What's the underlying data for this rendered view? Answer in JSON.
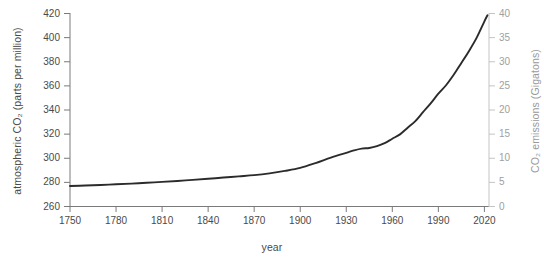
{
  "chart_data": {
    "type": "line",
    "title": "",
    "xlabel": "year",
    "ylabel": "atmospheric CO₂ (parts per million)",
    "ylabel_right": "CO₂ emissions (Gigatons)",
    "xlim": [
      1750,
      2023
    ],
    "ylim": [
      260,
      420
    ],
    "ylim_right": [
      0,
      40
    ],
    "grid": false,
    "legend": null,
    "xticks": [
      1750,
      1780,
      1810,
      1840,
      1870,
      1900,
      1930,
      1960,
      1990,
      2020
    ],
    "xtick_labels": [
      "1750",
      "1780",
      "1810",
      "1840",
      "1870",
      "1900",
      "1930",
      "1960",
      "1990",
      "2020"
    ],
    "yticks": [
      260,
      280,
      300,
      320,
      340,
      360,
      380,
      400,
      420
    ],
    "ytick_labels": [
      "260",
      "280",
      "300",
      "320",
      "340",
      "360",
      "380",
      "400",
      "420"
    ],
    "yticks_right": [
      0,
      5,
      10,
      15,
      20,
      25,
      30,
      35,
      40
    ],
    "ytick_labels_right": [
      "0",
      "5",
      "10",
      "15",
      "20",
      "25",
      "30",
      "35",
      "40"
    ],
    "line_color": "#2b2b2b",
    "line_width": 1.9,
    "series": [
      {
        "name": "atmospheric CO2",
        "x": [
          1750,
          1760,
          1770,
          1780,
          1790,
          1800,
          1810,
          1820,
          1830,
          1840,
          1850,
          1860,
          1870,
          1880,
          1890,
          1900,
          1910,
          1920,
          1930,
          1935,
          1940,
          1945,
          1950,
          1955,
          1960,
          1965,
          1970,
          1975,
          1980,
          1985,
          1990,
          1995,
          2000,
          2005,
          2010,
          2015,
          2020,
          2022
        ],
        "values": [
          277.0,
          277.4,
          277.8,
          278.4,
          279.0,
          279.7,
          280.4,
          281.2,
          282.1,
          283.0,
          284.0,
          285.0,
          286.0,
          287.5,
          289.5,
          292.0,
          296.0,
          300.5,
          304.5,
          306.5,
          308.0,
          308.5,
          310.0,
          312.5,
          316.2,
          319.8,
          325.3,
          330.8,
          338.2,
          345.5,
          353.5,
          360.5,
          369.2,
          379.0,
          389.0,
          400.0,
          413.5,
          418.5
        ]
      }
    ]
  },
  "axes": {
    "left_axis_color": "#7a7a7a",
    "right_axis_color": "#c4c4c4",
    "bottom_axis_color": "#7a7a7a"
  },
  "caption": {
    "text": ""
  }
}
